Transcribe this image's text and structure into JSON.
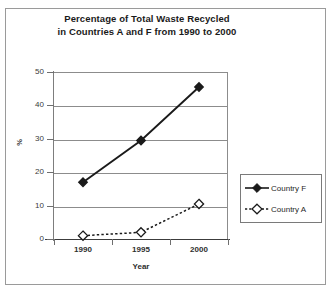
{
  "chart_data": {
    "type": "line",
    "title": "Percentage of Total Waste Recycled in Countries A and F from 1990 to 2000",
    "title_lines": [
      "Percentage of Total Waste Recycled",
      "in Countries A and F from 1990 to 2000"
    ],
    "xlabel": "Year",
    "ylabel": "%",
    "categories": [
      "1990",
      "1995",
      "2000"
    ],
    "x": [
      1990,
      1995,
      2000
    ],
    "ylim": [
      0,
      50
    ],
    "yticks": [
      0,
      10,
      20,
      30,
      40,
      50
    ],
    "ytick_labels": [
      "0",
      "10",
      "20",
      "30",
      "40",
      "50"
    ],
    "grid": "horizontal",
    "legend_position": "right",
    "series": [
      {
        "name": "Country F",
        "values": [
          17,
          29.5,
          45.5
        ],
        "marker": "filled-diamond",
        "linestyle": "solid",
        "color": "#1a1a1a"
      },
      {
        "name": "Country A",
        "values": [
          1,
          2,
          10.5
        ],
        "marker": "open-diamond",
        "linestyle": "dashed",
        "color": "#1a1a1a"
      }
    ]
  },
  "legend": {
    "entries": [
      {
        "label": "Country F"
      },
      {
        "label": "Country A"
      }
    ]
  },
  "colors": {
    "background": "#ffffff",
    "frame": "#9a9a9a",
    "gridline": "#8c8c8c",
    "axis": "#3c3c3c",
    "series": "#1a1a1a",
    "text": "#1a1a1a"
  }
}
